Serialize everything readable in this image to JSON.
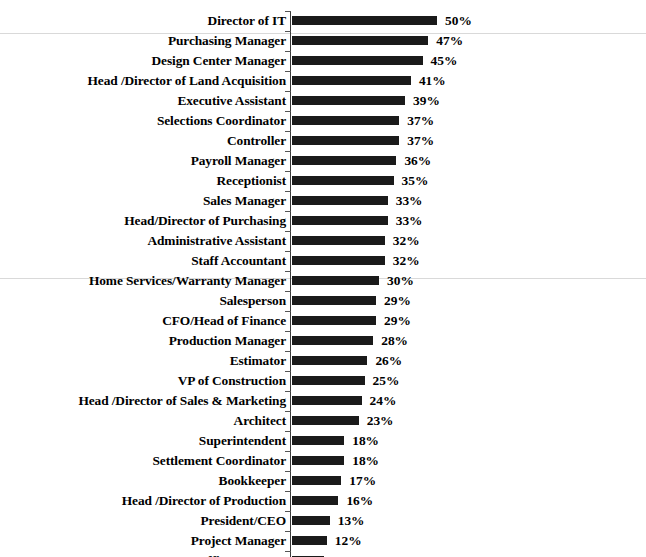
{
  "chart_data": {
    "type": "bar",
    "orientation": "horizontal",
    "title": "",
    "subtitle": "",
    "xlabel": "",
    "ylabel": "",
    "xlim": [
      0,
      50
    ],
    "grid": false,
    "legend": null,
    "value_suffix": "%",
    "bar_color": "#1a1a1a",
    "axis_color": "#3a3a3a",
    "text_color": "#000000",
    "categories": [
      "Director of IT",
      "Purchasing Manager",
      "Design Center Manager",
      "Head /Director of Land Acquisition",
      "Executive Assistant",
      "Selections Coordinator",
      "Controller",
      "Payroll Manager",
      "Receptionist",
      "Sales Manager",
      "Head/Director of Purchasing",
      "Administrative Assistant",
      "Staff Accountant",
      "Home Services/Warranty Manager",
      "Salesperson",
      "CFO/Head of Finance",
      "Production Manager",
      "Estimator",
      "VP of Construction",
      "Head /Director of Sales & Marketing",
      "Architect",
      "Superintendent",
      "Settlement Coordinator",
      "Bookkeeper",
      "Head /Director of Production",
      "President/CEO",
      "Project Manager",
      "Office Manager"
    ],
    "values": [
      50,
      47,
      45,
      41,
      39,
      37,
      37,
      36,
      35,
      33,
      33,
      32,
      32,
      30,
      29,
      29,
      28,
      26,
      25,
      24,
      23,
      18,
      18,
      17,
      16,
      13,
      12,
      11
    ],
    "value_labels": [
      "50%",
      "47%",
      "45%",
      "41%",
      "39%",
      "37%",
      "37%",
      "36%",
      "35%",
      "33%",
      "33%",
      "32%",
      "32%",
      "30%",
      "29%",
      "29%",
      "28%",
      "26%",
      "25%",
      "24%",
      "23%",
      "18%",
      "18%",
      "17%",
      "16%",
      "13%",
      "12%",
      "11%"
    ]
  }
}
